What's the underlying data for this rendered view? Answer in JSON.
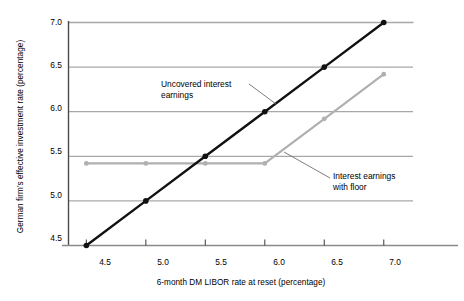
{
  "chart_data": {
    "type": "line",
    "title": "",
    "xlabel": "6-month DM LIBOR rate at reset (percentage)",
    "ylabel": "German firm's effective investment rate (percentage)",
    "xlim": [
      4.35,
      7.25
    ],
    "ylim": [
      4.5,
      7.0
    ],
    "xticks": [
      "4.5",
      "5.0",
      "5.5",
      "6.0",
      "6.5",
      "7.0"
    ],
    "yticks": [
      "4.5",
      "5.0",
      "5.5",
      "6.0",
      "6.5",
      "7.0"
    ],
    "xtick_values": [
      4.5,
      5.0,
      5.5,
      6.0,
      6.5,
      7.0
    ],
    "ytick_values": [
      4.5,
      5.0,
      5.5,
      6.0,
      6.5,
      7.0
    ],
    "grid": "horizontal",
    "gridline_values": [
      5.0,
      5.5,
      6.0,
      6.5,
      7.0
    ],
    "legend": "none",
    "x": [
      4.5,
      5.0,
      5.5,
      6.0,
      6.5,
      7.0
    ],
    "series": [
      {
        "name": "Uncovered interest earnings",
        "color": "#111111",
        "marker": "circle",
        "values": [
          4.5,
          5.0,
          5.5,
          6.0,
          6.5,
          7.0
        ]
      },
      {
        "name": "Interest earnings with floor",
        "color": "#b0b0b0",
        "marker": "circle",
        "values": [
          5.42,
          5.42,
          5.42,
          5.42,
          5.92,
          6.42
        ]
      }
    ],
    "annotations": [
      {
        "text_line1": "Uncovered interest",
        "text_line2": "earnings",
        "anchor_x": 6.0,
        "anchor_y": 6.0
      },
      {
        "text_line1": "Interest earnings",
        "text_line2": "with floor",
        "anchor_x": 6.0,
        "anchor_y": 5.42
      }
    ]
  },
  "colors": {
    "series_primary": "#111111",
    "series_secondary": "#b0b0b0",
    "gridline": "#a8a8a8",
    "axis": "#555555",
    "text": "#000000",
    "background": "#ffffff"
  },
  "annotation_labels": {
    "uncovered_line1": "Uncovered interest",
    "uncovered_line2": "earnings",
    "floor_line1": "Interest earnings",
    "floor_line2": "with floor"
  }
}
